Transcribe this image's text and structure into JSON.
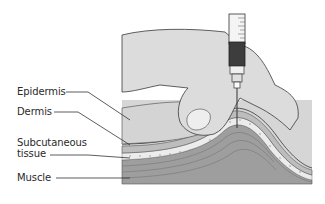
{
  "diagram": {
    "labels": [
      {
        "id": "epidermis",
        "text": "Epidermis"
      },
      {
        "id": "dermis",
        "text": "Dermis"
      },
      {
        "id": "subcutaneous",
        "text": "Subcutaneous\ntissue",
        "line1": "Subcutaneous",
        "line2": "tissue"
      },
      {
        "id": "muscle",
        "text": "Muscle"
      }
    ],
    "colors": {
      "background": "#ffffff",
      "skin": "#d9d9d9",
      "hand": "#dcdcdc",
      "dermis": "#c8c8c8",
      "subcutaneous": "#e6e6e6",
      "muscle": "#9e9e9e",
      "outline": "#3a3a3a",
      "syringe_fill": "#3d3d3d"
    }
  }
}
